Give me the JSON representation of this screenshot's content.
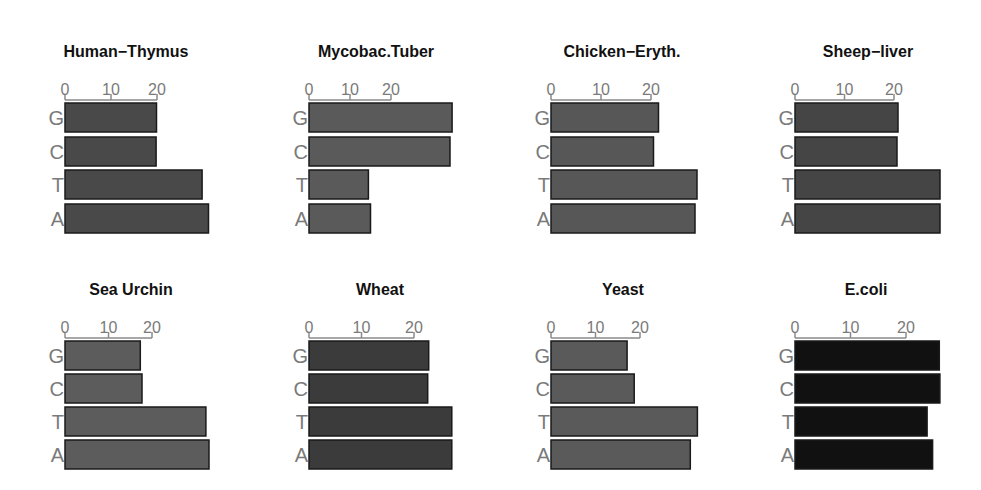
{
  "chart_data": [
    {
      "type": "bar",
      "orientation": "horizontal",
      "title": "Human−Thymus",
      "categories": [
        "G",
        "C",
        "T",
        "A"
      ],
      "values": [
        19.9,
        19.8,
        29.8,
        31.2
      ],
      "xticks": [
        0,
        10,
        20
      ],
      "xlabel": "",
      "ylabel": "",
      "fill": "#494949",
      "layout": {
        "x0": 65,
        "px_per_unit": 4.6,
        "row": 0,
        "title_cx": 126
      }
    },
    {
      "type": "bar",
      "orientation": "horizontal",
      "title": "Mycobac.Tuber",
      "categories": [
        "G",
        "C",
        "T",
        "A"
      ],
      "values": [
        34.9,
        34.4,
        14.5,
        15.0
      ],
      "xticks": [
        0,
        10,
        20
      ],
      "xlabel": "",
      "ylabel": "",
      "fill": "#5a5a5a",
      "layout": {
        "x0": 309,
        "px_per_unit": 4.1,
        "row": 0,
        "title_cx": 376
      }
    },
    {
      "type": "bar",
      "orientation": "horizontal",
      "title": "Chicken−Eryth.",
      "categories": [
        "G",
        "C",
        "T",
        "A"
      ],
      "values": [
        21.5,
        20.5,
        29.2,
        28.8
      ],
      "xticks": [
        0,
        10,
        20
      ],
      "xlabel": "",
      "ylabel": "",
      "fill": "#575757",
      "layout": {
        "x0": 551,
        "px_per_unit": 5.0,
        "row": 0,
        "title_cx": 622
      }
    },
    {
      "type": "bar",
      "orientation": "horizontal",
      "title": "Sheep−liver",
      "categories": [
        "G",
        "C",
        "T",
        "A"
      ],
      "values": [
        20.8,
        20.6,
        29.3,
        29.3
      ],
      "xticks": [
        0,
        10,
        20
      ],
      "xlabel": "",
      "ylabel": "",
      "fill": "#454545",
      "layout": {
        "x0": 795,
        "px_per_unit": 4.95,
        "row": 0,
        "title_cx": 868
      }
    },
    {
      "type": "bar",
      "orientation": "horizontal",
      "title": "Sea Urchin",
      "categories": [
        "G",
        "C",
        "T",
        "A"
      ],
      "values": [
        17.3,
        17.7,
        32.4,
        33.1
      ],
      "xticks": [
        0,
        10,
        20
      ],
      "xlabel": "",
      "ylabel": "",
      "fill": "#5c5c5c",
      "layout": {
        "x0": 65,
        "px_per_unit": 4.35,
        "row": 1,
        "title_cx": 131
      }
    },
    {
      "type": "bar",
      "orientation": "horizontal",
      "title": "Wheat",
      "categories": [
        "G",
        "C",
        "T",
        "A"
      ],
      "values": [
        22.8,
        22.6,
        27.2,
        27.2
      ],
      "xticks": [
        0,
        10,
        20
      ],
      "xlabel": "",
      "ylabel": "",
      "fill": "#3b3b3b",
      "layout": {
        "x0": 309,
        "px_per_unit": 5.25,
        "row": 1,
        "title_cx": 380
      }
    },
    {
      "type": "bar",
      "orientation": "horizontal",
      "title": "Yeast",
      "categories": [
        "G",
        "C",
        "T",
        "A"
      ],
      "values": [
        17.1,
        18.7,
        32.9,
        31.3
      ],
      "xticks": [
        0,
        10,
        20
      ],
      "xlabel": "",
      "ylabel": "",
      "fill": "#5a5a5a",
      "layout": {
        "x0": 551,
        "px_per_unit": 4.45,
        "row": 1,
        "title_cx": 623
      }
    },
    {
      "type": "bar",
      "orientation": "horizontal",
      "title": "E.coli",
      "categories": [
        "G",
        "C",
        "T",
        "A"
      ],
      "values": [
        26.0,
        26.1,
        23.8,
        24.8
      ],
      "xticks": [
        0,
        10,
        20
      ],
      "xlabel": "",
      "ylabel": "",
      "fill": "#111111",
      "layout": {
        "x0": 795,
        "px_per_unit": 5.55,
        "row": 1,
        "title_cx": 866
      }
    }
  ],
  "grid": {
    "rows": 2,
    "cols": 4,
    "show_gridlines": false,
    "legend": "none"
  }
}
